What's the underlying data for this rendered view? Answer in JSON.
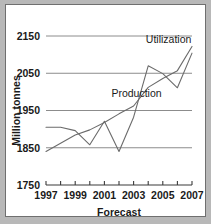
{
  "chart_data": {
    "type": "line",
    "title": "",
    "xlabel": "Forecast",
    "ylabel": "Million tonnes",
    "x": [
      1997,
      1998,
      1999,
      2000,
      2001,
      2002,
      2003,
      2004,
      2005,
      2006,
      2007
    ],
    "xtick_labels": [
      "1997",
      "",
      "1999",
      "",
      "2001",
      "",
      "2003",
      "",
      "2005",
      "",
      "2007"
    ],
    "xtick_values": [
      1997,
      1998,
      1999,
      2000,
      2001,
      2002,
      2003,
      2004,
      2005,
      2006,
      2007
    ],
    "xlim": [
      1997,
      2007
    ],
    "ytick_labels": [
      "1750",
      "1850",
      "1950",
      "2050",
      "2150"
    ],
    "ytick_values": [
      1750,
      1850,
      1950,
      2050,
      2150
    ],
    "ylim": [
      1750,
      2150
    ],
    "grid": "horizontal",
    "legend_position": "inline-annotation",
    "series": [
      {
        "name": "Utilization",
        "label": "Utilization",
        "color": "#6b6b6b",
        "values": [
          1840,
          1862,
          1884,
          1898,
          1918,
          1941,
          1962,
          2012,
          2036,
          2057,
          2122
        ],
        "label_x": 2005.4,
        "label_y": 2141
      },
      {
        "name": "Production",
        "label": "Production",
        "color": "#6b6b6b",
        "values": [
          1905,
          1905,
          1896,
          1858,
          1921,
          1840,
          1932,
          2070,
          2049,
          2011,
          2104
        ],
        "label_x": 2003.2,
        "label_y": 1996
      }
    ]
  },
  "axis": {
    "y_title": "Million tonnes",
    "x_title": "Forecast"
  },
  "colors": {
    "line": "#6b6b6b",
    "grid": "#8c8c8c",
    "axis": "#3a3a3a",
    "text": "#1a1a1a",
    "plot_background": "#ffffff",
    "page_background": "#b8b8b8"
  }
}
